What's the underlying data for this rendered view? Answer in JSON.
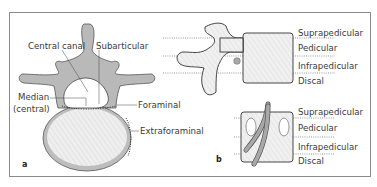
{
  "figure": {
    "panel_a": {
      "letter": "a",
      "labels": {
        "central_canal": "Central canal",
        "subarticular": "Subarticular",
        "median_line1": "Median",
        "median_line2": "(central)",
        "foraminal": "Foraminal",
        "extraforaminal": "Extraforaminal"
      }
    },
    "panel_b": {
      "letter": "b",
      "upper_zones": [
        "Suprapedicular",
        "Pedicular",
        "Infrapedicular",
        "Discal"
      ],
      "lower_zones": [
        "Suprapedicular",
        "Pedicular",
        "Infrapedicular",
        "Discal"
      ]
    }
  },
  "colors": {
    "bone_fill": "#b9b9b9",
    "body_fill": "#ececec",
    "outline": "#3a3a3a",
    "frame": "#8a8a8a",
    "dotted_line": "#555555"
  }
}
